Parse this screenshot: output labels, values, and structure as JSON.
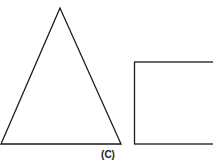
{
  "figure": {
    "label": "(C)",
    "stroke_color": "#1a1a1a",
    "shapes": [
      {
        "type": "triangle",
        "name": "isosceles-triangle"
      },
      {
        "type": "rectangle",
        "name": "rectangle"
      }
    ]
  }
}
